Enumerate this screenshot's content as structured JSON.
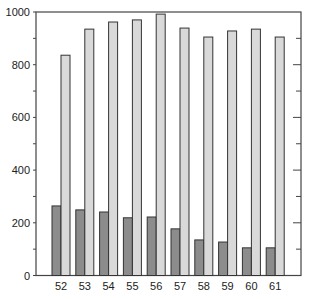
{
  "chart_data": {
    "type": "bar",
    "title": "",
    "xlabel": "",
    "ylabel": "",
    "ylim": [
      0,
      1000
    ],
    "yticks": [
      0,
      200,
      400,
      600,
      800,
      1000
    ],
    "yminor_step": 100,
    "grid": false,
    "legend": null,
    "categories": [
      "52",
      "53",
      "54",
      "55",
      "56",
      "57",
      "58",
      "59",
      "60",
      "61"
    ],
    "series": [
      {
        "name": "Series A (dark)",
        "color": "#8c8c8c",
        "values": [
          264,
          249,
          241,
          219,
          222,
          177,
          135,
          127,
          105,
          105
        ]
      },
      {
        "name": "Series B (light)",
        "color": "#d9d9d9",
        "values": [
          836,
          935,
          962,
          970,
          992,
          939,
          905,
          928,
          935,
          905
        ]
      }
    ]
  },
  "style": {
    "outline_color": "#333333",
    "axis_color": "#444444"
  }
}
